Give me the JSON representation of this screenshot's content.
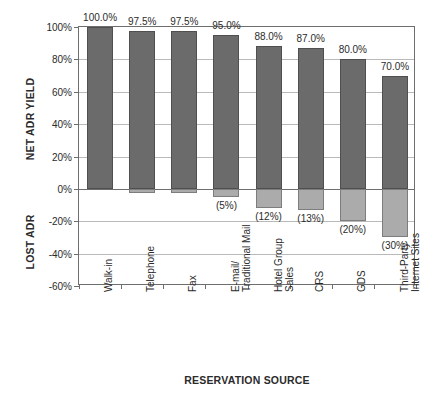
{
  "chart_data": {
    "type": "bar",
    "title": "",
    "subtitle": "",
    "xlabel": "RESERVATION SOURCE",
    "ylabel_upper": "NET ADR YIELD",
    "ylabel_lower": "LOST ADR",
    "grid": true,
    "legend": "none",
    "ylim": [
      -60,
      100
    ],
    "yticks": [
      100,
      80,
      60,
      40,
      20,
      0,
      -20,
      -40,
      -60
    ],
    "ytick_labels": [
      "100%",
      "80%",
      "60%",
      "40%",
      "20%",
      "0%",
      "-20%",
      "-40%",
      "-60%"
    ],
    "categories": [
      "Walk-in",
      "Telephone",
      "Fax",
      "E-mail/\nTraditional Mail",
      "Hotel Group\nSales",
      "CRS",
      "GDS",
      "Third-Party\nInternet Sites"
    ],
    "series": [
      {
        "name": "NET ADR YIELD",
        "color": "#6b6b6b",
        "values": [
          100.0,
          97.5,
          97.5,
          95.0,
          88.0,
          87.0,
          80.0,
          70.0
        ],
        "labels": [
          "100.0%",
          "97.5%",
          "97.5%",
          "95.0%",
          "88.0%",
          "87.0%",
          "80.0%",
          "70.0%"
        ]
      },
      {
        "name": "LOST ADR",
        "color": "#ababab",
        "values": [
          0,
          -2.5,
          -2.5,
          -5.0,
          -12.0,
          -13.0,
          -20.0,
          -30.0
        ],
        "labels": [
          "",
          "",
          "",
          "(5%)",
          "(12%)",
          "(13%)",
          "(20%)",
          "(30%)"
        ]
      }
    ],
    "colors": {
      "net_adr_yield_bar": "#6b6b6b",
      "lost_adr_bar": "#ababab",
      "gridline": "#b9b9b9",
      "axis": "#6e6e6e",
      "text": "#2b2b2b",
      "background": "#ffffff"
    }
  }
}
